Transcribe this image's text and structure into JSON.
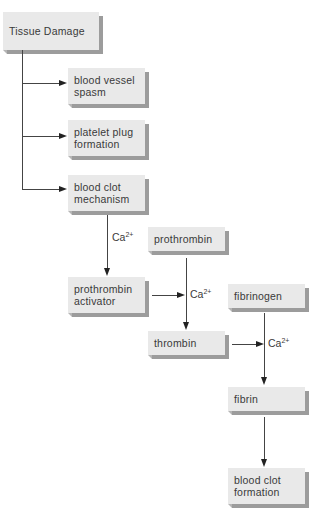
{
  "diagram": {
    "nodes": {
      "tissue_damage": "Tissue Damage",
      "blood_vessel_spasm": [
        "blood vessel",
        "spasm"
      ],
      "platelet_plug_formation": [
        "platelet plug",
        "formation"
      ],
      "blood_clot_mechanism": [
        "blood clot",
        "mechanism"
      ],
      "prothrombin": "prothrombin",
      "prothrombin_activator": [
        "prothrombin",
        "activator"
      ],
      "fibrinogen": "fibrinogen",
      "thrombin": "thrombin",
      "fibrin": "fibrin",
      "blood_clot_formation": [
        "blood clot",
        "formation"
      ]
    },
    "cofactor": {
      "base": "Ca",
      "superscript": "2+"
    },
    "edges": [
      {
        "from": "Tissue Damage",
        "to": "blood vessel spasm"
      },
      {
        "from": "Tissue Damage",
        "to": "platelet plug formation"
      },
      {
        "from": "Tissue Damage",
        "to": "blood clot mechanism"
      },
      {
        "from": "blood clot mechanism",
        "to": "prothrombin activator",
        "label": "Ca2+"
      },
      {
        "from": "prothrombin activator",
        "to": "prothrombin→thrombin",
        "label": "Ca2+"
      },
      {
        "from": "prothrombin",
        "to": "thrombin"
      },
      {
        "from": "thrombin",
        "to": "fibrinogen→fibrin",
        "label": "Ca2+"
      },
      {
        "from": "fibrinogen",
        "to": "fibrin"
      },
      {
        "from": "fibrin",
        "to": "blood clot formation"
      }
    ],
    "colors": {
      "box_face": "#e9e9e9",
      "box_shadow": "#9c9c9c",
      "line": "#444444",
      "text": "#3a3a3a"
    }
  }
}
